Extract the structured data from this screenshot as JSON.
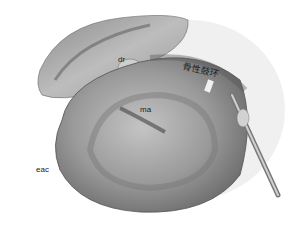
{
  "figure": {
    "type": "anatomical-illustration",
    "labels": {
      "dr": "dr",
      "ma": "ma",
      "eac": "eac",
      "annulus": "骨性鼓环"
    },
    "colors": {
      "background": "#ffffff",
      "tissue": "#a8a8a8",
      "shadow": "#4a4a4a"
    }
  }
}
